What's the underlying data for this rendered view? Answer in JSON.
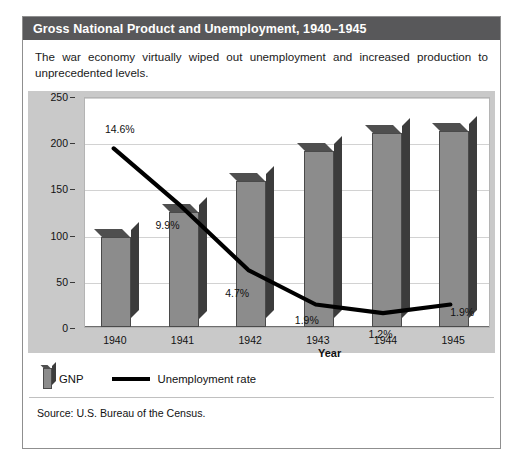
{
  "figure": {
    "header_title": "Gross National Product and Unemployment, 1940–1945",
    "intro": "The war economy virtually wiped out unemployment and increased production to unprecedented levels.",
    "source": "Source: U.S. Bureau of the Census."
  },
  "legend": {
    "gnp_label": "GNP",
    "unemployment_label": "Unemployment rate",
    "bar_swatch_icon": "bar-swatch-icon",
    "line_swatch_icon": "line-swatch-icon"
  },
  "colors": {
    "header_bg": "#58585a",
    "panel_bg": "#c9c9c9",
    "plot_bg": "#ffffff",
    "bar_face": "#8c8c8c",
    "bar_top": "#4f4f4f",
    "bar_side": "#3c3c3c",
    "line": "#000000",
    "gridline": "#d2d2d2"
  },
  "chart_data": {
    "type": "bar",
    "title": "Gross National Product and Unemployment, 1940–1945",
    "categories": [
      "1940",
      "1941",
      "1942",
      "1943",
      "1944",
      "1945"
    ],
    "xlabel": "Year",
    "ylabel": "GNP (in billions of dollars)",
    "ylim": [
      0,
      250
    ],
    "yticks": [
      0,
      50,
      100,
      150,
      200,
      250
    ],
    "grid": true,
    "legend_position": "below-plot",
    "series": [
      {
        "name": "GNP",
        "type": "bar",
        "unit": "billions of dollars",
        "values": [
          97,
          125,
          158,
          191,
          210,
          212
        ]
      },
      {
        "name": "Unemployment rate",
        "type": "line",
        "unit": "percent",
        "values": [
          14.6,
          9.9,
          4.7,
          1.9,
          1.2,
          1.9
        ],
        "point_labels": [
          "14.6%",
          "9.9%",
          "4.7%",
          "1.9%",
          "1.2%",
          "1.9%"
        ]
      }
    ]
  }
}
